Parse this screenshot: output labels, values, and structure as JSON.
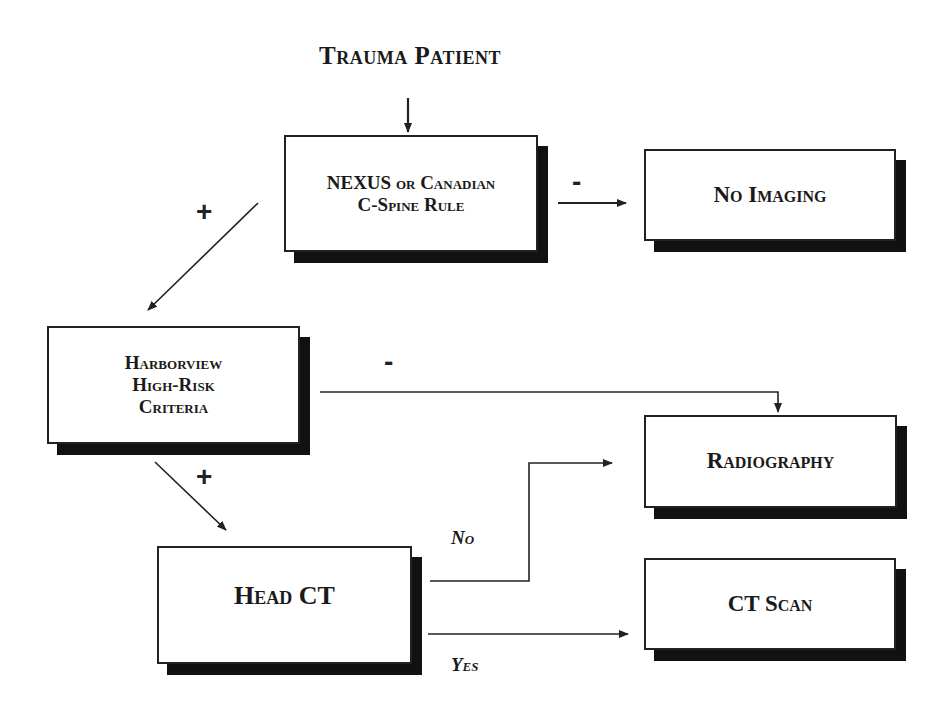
{
  "title": "Trauma Patient",
  "nodes": {
    "nexus": {
      "label_line1": "NEXUS or Canadian",
      "label_line2": "C-Spine Rule"
    },
    "no_imaging": {
      "label": "No Imaging"
    },
    "harborview": {
      "label_line1": "Harborview",
      "label_line2": "High-Risk",
      "label_line3": "Criteria"
    },
    "radiography": {
      "label": "Radiography"
    },
    "head_ct": {
      "label": "Head CT"
    },
    "ct_scan": {
      "label": "CT Scan"
    }
  },
  "edges": {
    "nexus_negative": "-",
    "nexus_positive": "+",
    "harborview_negative": "-",
    "harborview_positive": "+",
    "head_ct_no": "No",
    "head_ct_yes": "Yes"
  },
  "colors": {
    "line": "#222222",
    "shadow": "#111111",
    "background": "#ffffff"
  }
}
